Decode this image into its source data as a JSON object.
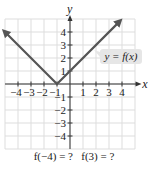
{
  "chart_data": {
    "type": "line",
    "title": "",
    "function_label": "y = f(x)",
    "xlabel": "x",
    "ylabel": "y",
    "xlim": [
      -5,
      5
    ],
    "ylim": [
      -5,
      5
    ],
    "x_ticks": [
      -4,
      -3,
      -2,
      -1,
      1,
      2,
      3,
      4
    ],
    "y_ticks": [
      -4,
      -3,
      -2,
      -1,
      1,
      2,
      3,
      4
    ],
    "grid": true,
    "series": [
      {
        "name": "y = f(x)",
        "description": "V-shaped absolute value graph with vertex at (-1, 0), arrows at both ends",
        "points": [
          [
            -5,
            4
          ],
          [
            -1,
            0
          ],
          [
            3.8,
            4.8
          ]
        ]
      }
    ]
  },
  "question": {
    "text": "f(−4) = ?   f(3) = ?",
    "part1": "f(−4) = ?",
    "part2": "f(3) = ?"
  },
  "colors": {
    "line": "#555555",
    "grid": "#dddddd",
    "axis": "#333333",
    "label_bg": "#e6e6e6"
  }
}
